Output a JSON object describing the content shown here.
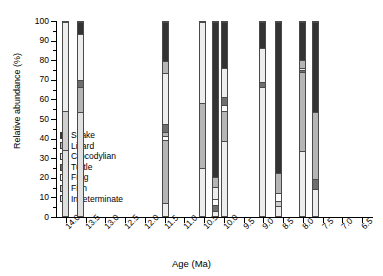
{
  "chart_data": {
    "type": "bar",
    "subtype": "stacked-percentage",
    "title": "",
    "xlabel": "Age (Ma)",
    "ylabel": "Relative abundance (%)",
    "ylim": [
      0,
      100
    ],
    "ytick_step": 10,
    "yticks": [
      0,
      10,
      20,
      30,
      40,
      50,
      60,
      70,
      80,
      90,
      100
    ],
    "xlim": [
      14.25,
      6.25
    ],
    "x_axis_reversed": true,
    "xticks": [
      14.0,
      13.5,
      13.0,
      12.5,
      12.0,
      11.5,
      11.0,
      10.5,
      10.0,
      9.5,
      9.0,
      8.5,
      8.0,
      7.5,
      7.0,
      6.5
    ],
    "xticklabels": [
      "14.0",
      "13.5",
      "13.0",
      "12.5",
      "12.0",
      "11.5",
      "11.0",
      "10.5",
      "10.0",
      "9.5",
      "9.0",
      "8.5",
      "8.0",
      "7.5",
      "7.0",
      "6.5"
    ],
    "grid": false,
    "legend_position": "inside-left",
    "legend_title": "",
    "categories": [
      "Snake",
      "Lizard",
      "Crocodylian",
      "Turtle",
      "Frog",
      "Fish",
      "Indeterminate"
    ],
    "colors": {
      "Snake": "#333333",
      "Lizard": "#b5b5b5",
      "Crocodylian": "#ededed",
      "Turtle": "#6e6e6e",
      "Frog": "#fbfbfb",
      "Fish": "#cfcfcf",
      "Indeterminate": "#e0e0e0"
    },
    "bars": [
      {
        "age": 14.0,
        "label": "14.0",
        "x_center": 14.0,
        "width_ma": 0.18,
        "segments": [
          {
            "name": "Indeterminate",
            "value": 34.0
          },
          {
            "name": "Fish",
            "value": 20.0
          },
          {
            "name": "Crocodylian",
            "value": 46.0
          }
        ]
      },
      {
        "age": 13.62,
        "label": "13.6",
        "x_center": 13.62,
        "width_ma": 0.18,
        "segments": [
          {
            "name": "Indeterminate",
            "value": 53.5
          },
          {
            "name": "Lizard",
            "value": 13.0
          },
          {
            "name": "Turtle",
            "value": 3.5
          },
          {
            "name": "Crocodylian",
            "value": 24.0
          },
          {
            "name": "Snake",
            "value": 6.0
          }
        ]
      },
      {
        "age": 11.48,
        "label": "11.5",
        "x_center": 11.48,
        "width_ma": 0.18,
        "segments": [
          {
            "name": "Crocodylian",
            "value": 6.5
          },
          {
            "name": "Lizard",
            "value": 32.5
          },
          {
            "name": "Frog",
            "value": 2.0
          },
          {
            "name": "Lizard",
            "value": 2.5
          },
          {
            "name": "Turtle",
            "value": 4.0
          },
          {
            "name": "Crocodylian",
            "value": 26.0
          },
          {
            "name": "Lizard",
            "value": 6.5
          },
          {
            "name": "Snake",
            "value": 20.0
          }
        ]
      },
      {
        "age": 10.55,
        "label": "10.5",
        "x_center": 10.55,
        "width_ma": 0.18,
        "segments": [
          {
            "name": "Crocodylian",
            "value": 25.0
          },
          {
            "name": "Lizard",
            "value": 33.0
          },
          {
            "name": "Crocodylian",
            "value": 42.0
          }
        ]
      },
      {
        "age": 10.22,
        "label": "10.2",
        "x_center": 10.22,
        "width_ma": 0.18,
        "segments": [
          {
            "name": "Crocodylian",
            "value": 2.5
          },
          {
            "name": "Turtle",
            "value": 3.0
          },
          {
            "name": "Frog",
            "value": 3.5
          },
          {
            "name": "Crocodylian",
            "value": 6.0
          },
          {
            "name": "Lizard",
            "value": 5.0
          },
          {
            "name": "Snake",
            "value": 80.0
          }
        ]
      },
      {
        "age": 9.98,
        "label": "10.0",
        "x_center": 9.98,
        "width_ma": 0.18,
        "segments": [
          {
            "name": "Crocodylian",
            "value": 38.5
          },
          {
            "name": "Lizard",
            "value": 15.5
          },
          {
            "name": "Frog",
            "value": 3.0
          },
          {
            "name": "Turtle",
            "value": 4.5
          },
          {
            "name": "Crocodylian",
            "value": 15.0
          },
          {
            "name": "Snake",
            "value": 23.5
          }
        ]
      },
      {
        "age": 9.03,
        "label": "9.0",
        "x_center": 9.03,
        "width_ma": 0.18,
        "segments": [
          {
            "name": "Crocodylian",
            "value": 66.5
          },
          {
            "name": "Turtle",
            "value": 2.5
          },
          {
            "name": "Crocodylian",
            "value": 17.5
          },
          {
            "name": "Snake",
            "value": 13.5
          }
        ]
      },
      {
        "age": 8.62,
        "label": "8.6",
        "x_center": 8.62,
        "width_ma": 0.18,
        "segments": [
          {
            "name": "Crocodylian",
            "value": 5.0
          },
          {
            "name": "Fish",
            "value": 3.0
          },
          {
            "name": "Frog",
            "value": 4.0
          },
          {
            "name": "Lizard",
            "value": 10.0
          },
          {
            "name": "Snake",
            "value": 78.0
          }
        ]
      },
      {
        "age": 8.02,
        "label": "8.0",
        "x_center": 8.02,
        "width_ma": 0.18,
        "segments": [
          {
            "name": "Crocodylian",
            "value": 33.5
          },
          {
            "name": "Lizard",
            "value": 40.5
          },
          {
            "name": "Turtle",
            "value": 1.5
          },
          {
            "name": "Crocodylian",
            "value": 1.0
          },
          {
            "name": "Lizard",
            "value": 4.0
          },
          {
            "name": "Snake",
            "value": 19.5
          }
        ]
      },
      {
        "age": 7.68,
        "label": "7.7",
        "x_center": 7.68,
        "width_ma": 0.18,
        "segments": [
          {
            "name": "Crocodylian",
            "value": 14.0
          },
          {
            "name": "Turtle",
            "value": 5.0
          },
          {
            "name": "Lizard",
            "value": 34.5
          },
          {
            "name": "Snake",
            "value": 46.5
          }
        ]
      }
    ]
  },
  "legend": {
    "items": [
      {
        "label": "Snake",
        "color": "#333333"
      },
      {
        "label": "Lizard",
        "color": "#b5b5b5"
      },
      {
        "label": "Crocodylian",
        "color": "#ededed"
      },
      {
        "label": "Turtle",
        "color": "#6e6e6e"
      },
      {
        "label": "Frog",
        "color": "#fbfbfb"
      },
      {
        "label": "Fish",
        "color": "#cfcfcf"
      },
      {
        "label": "Indeterminate",
        "color": "#e0e0e0"
      }
    ]
  },
  "axes": {
    "y_title": "Relative abundance (%)",
    "x_title": "Age (Ma)"
  }
}
